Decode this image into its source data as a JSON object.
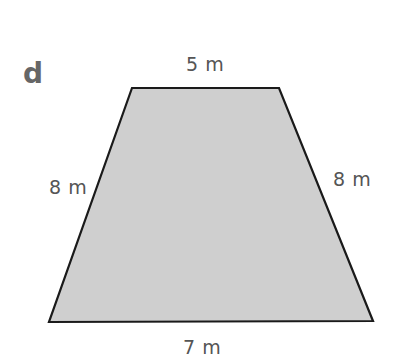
{
  "figure": {
    "part_label": "d",
    "shape": "trapezium",
    "fill_color": "#cfcfcf",
    "stroke_color": "#1a1a1a",
    "vertices": {
      "top_left": [
        132,
        88
      ],
      "top_right": [
        279,
        88
      ],
      "bottom_right": [
        373,
        321
      ],
      "bottom_left": [
        49,
        322
      ]
    },
    "labels": {
      "top": "5 m",
      "left": "8 m",
      "right": "8 m",
      "bottom": "7 m"
    }
  }
}
